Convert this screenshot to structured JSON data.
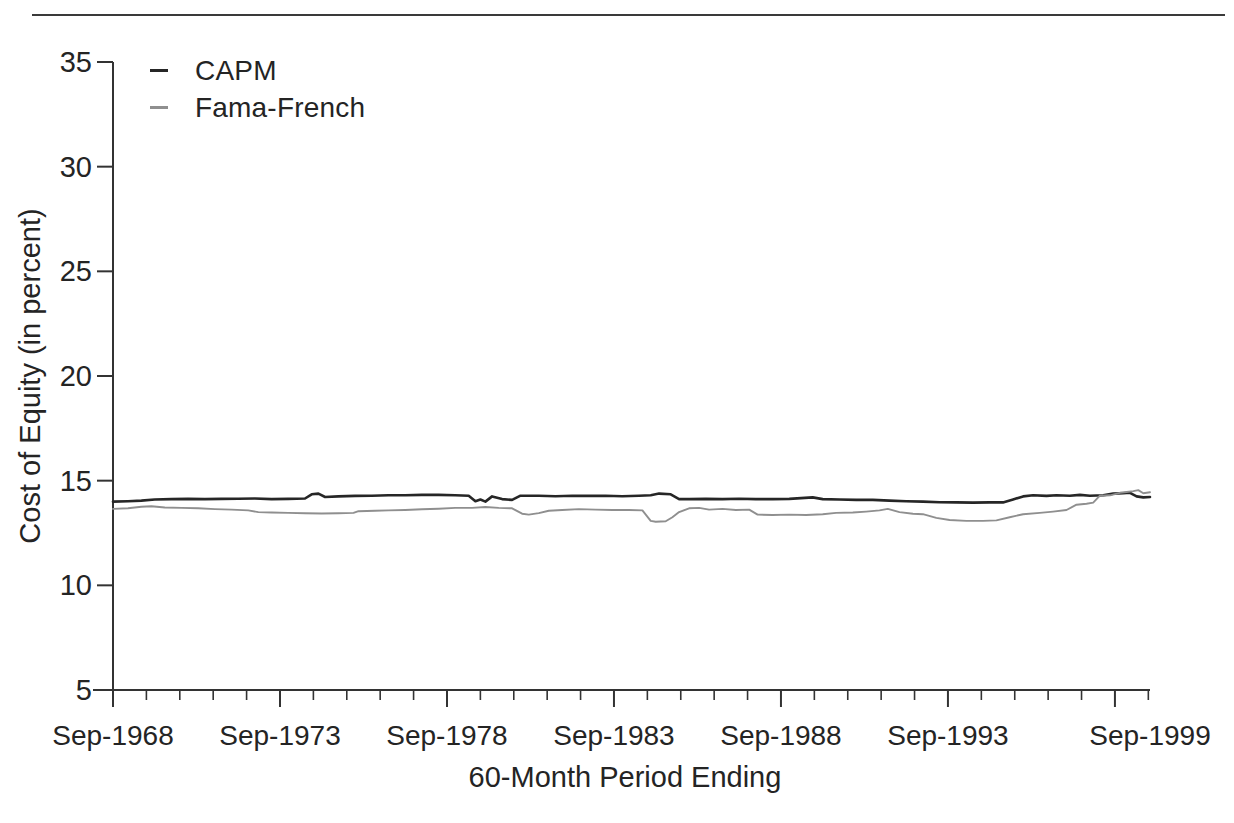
{
  "legend": {
    "items": [
      {
        "label": "CAPM",
        "color": "#262626"
      },
      {
        "label": "Fama-French",
        "color": "#8f8f8f"
      }
    ]
  },
  "chart_data": {
    "type": "line",
    "title": "",
    "xlabel": "60-Month Period Ending",
    "ylabel": "Cost of Equity (in percent)",
    "ylim": [
      5,
      35
    ],
    "y_ticks": [
      5,
      10,
      15,
      20,
      25,
      30,
      35
    ],
    "x_range_years": [
      1968.75,
      1999.8
    ],
    "x_major_tick_years": [
      1968.75,
      1973.75,
      1978.75,
      1983.75,
      1988.75,
      1993.75,
      1998.75
    ],
    "x_minor_tick_step_years": 1,
    "x_tick_labels": [
      "Sep-1968",
      "Sep-1973",
      "Sep-1978",
      "Sep-1983",
      "Sep-1988",
      "Sep-1993",
      "Sep-1999"
    ],
    "grid": false,
    "legend_position": "inside-top-left",
    "series": [
      {
        "name": "CAPM",
        "color": "#262626",
        "width": 2.6,
        "points": [
          [
            1968.75,
            14.0
          ],
          [
            1969.2,
            14.02
          ],
          [
            1969.6,
            14.05
          ],
          [
            1970.0,
            14.1
          ],
          [
            1970.5,
            14.12
          ],
          [
            1971.0,
            14.13
          ],
          [
            1971.5,
            14.12
          ],
          [
            1972.0,
            14.13
          ],
          [
            1972.5,
            14.14
          ],
          [
            1973.0,
            14.15
          ],
          [
            1973.5,
            14.12
          ],
          [
            1974.0,
            14.13
          ],
          [
            1974.5,
            14.15
          ],
          [
            1974.7,
            14.35
          ],
          [
            1974.9,
            14.38
          ],
          [
            1975.1,
            14.22
          ],
          [
            1975.5,
            14.25
          ],
          [
            1976.0,
            14.27
          ],
          [
            1976.5,
            14.28
          ],
          [
            1977.0,
            14.3
          ],
          [
            1977.5,
            14.3
          ],
          [
            1978.0,
            14.32
          ],
          [
            1978.5,
            14.32
          ],
          [
            1979.0,
            14.3
          ],
          [
            1979.4,
            14.28
          ],
          [
            1979.6,
            14.02
          ],
          [
            1979.75,
            14.1
          ],
          [
            1979.9,
            14.0
          ],
          [
            1980.1,
            14.25
          ],
          [
            1980.4,
            14.12
          ],
          [
            1980.7,
            14.08
          ],
          [
            1980.95,
            14.28
          ],
          [
            1981.5,
            14.28
          ],
          [
            1982.0,
            14.26
          ],
          [
            1982.5,
            14.28
          ],
          [
            1983.0,
            14.27
          ],
          [
            1983.5,
            14.28
          ],
          [
            1984.0,
            14.26
          ],
          [
            1984.5,
            14.28
          ],
          [
            1984.85,
            14.3
          ],
          [
            1985.1,
            14.38
          ],
          [
            1985.45,
            14.35
          ],
          [
            1985.7,
            14.12
          ],
          [
            1986.0,
            14.12
          ],
          [
            1986.5,
            14.13
          ],
          [
            1987.0,
            14.12
          ],
          [
            1987.5,
            14.14
          ],
          [
            1988.0,
            14.12
          ],
          [
            1988.5,
            14.12
          ],
          [
            1989.0,
            14.13
          ],
          [
            1989.7,
            14.2
          ],
          [
            1990.0,
            14.12
          ],
          [
            1990.5,
            14.1
          ],
          [
            1991.0,
            14.08
          ],
          [
            1991.5,
            14.08
          ],
          [
            1992.0,
            14.05
          ],
          [
            1992.5,
            14.02
          ],
          [
            1993.0,
            14.0
          ],
          [
            1993.5,
            13.97
          ],
          [
            1994.0,
            13.96
          ],
          [
            1994.5,
            13.95
          ],
          [
            1995.0,
            13.96
          ],
          [
            1995.4,
            13.96
          ],
          [
            1995.7,
            14.1
          ],
          [
            1996.0,
            14.25
          ],
          [
            1996.3,
            14.3
          ],
          [
            1996.7,
            14.27
          ],
          [
            1997.0,
            14.3
          ],
          [
            1997.4,
            14.28
          ],
          [
            1997.7,
            14.32
          ],
          [
            1998.0,
            14.28
          ],
          [
            1998.4,
            14.3
          ],
          [
            1998.7,
            14.38
          ],
          [
            1999.0,
            14.4
          ],
          [
            1999.2,
            14.42
          ],
          [
            1999.4,
            14.25
          ],
          [
            1999.6,
            14.2
          ],
          [
            1999.8,
            14.22
          ]
        ]
      },
      {
        "name": "Fama-French",
        "color": "#8f8f8f",
        "width": 1.9,
        "points": [
          [
            1968.75,
            13.65
          ],
          [
            1969.2,
            13.68
          ],
          [
            1969.6,
            13.75
          ],
          [
            1969.9,
            13.78
          ],
          [
            1970.3,
            13.72
          ],
          [
            1970.8,
            13.7
          ],
          [
            1971.3,
            13.68
          ],
          [
            1971.8,
            13.64
          ],
          [
            1972.3,
            13.62
          ],
          [
            1972.8,
            13.58
          ],
          [
            1973.1,
            13.5
          ],
          [
            1973.5,
            13.48
          ],
          [
            1974.0,
            13.46
          ],
          [
            1974.5,
            13.44
          ],
          [
            1975.0,
            13.43
          ],
          [
            1975.5,
            13.44
          ],
          [
            1975.95,
            13.46
          ],
          [
            1976.1,
            13.54
          ],
          [
            1976.6,
            13.56
          ],
          [
            1977.0,
            13.58
          ],
          [
            1977.5,
            13.6
          ],
          [
            1978.0,
            13.63
          ],
          [
            1978.5,
            13.66
          ],
          [
            1979.0,
            13.7
          ],
          [
            1979.5,
            13.7
          ],
          [
            1979.9,
            13.74
          ],
          [
            1980.3,
            13.7
          ],
          [
            1980.7,
            13.68
          ],
          [
            1981.0,
            13.42
          ],
          [
            1981.2,
            13.38
          ],
          [
            1981.5,
            13.45
          ],
          [
            1981.8,
            13.56
          ],
          [
            1982.2,
            13.6
          ],
          [
            1982.7,
            13.64
          ],
          [
            1983.2,
            13.62
          ],
          [
            1983.7,
            13.6
          ],
          [
            1984.2,
            13.6
          ],
          [
            1984.6,
            13.58
          ],
          [
            1984.85,
            13.08
          ],
          [
            1985.0,
            13.04
          ],
          [
            1985.3,
            13.06
          ],
          [
            1985.5,
            13.25
          ],
          [
            1985.7,
            13.5
          ],
          [
            1986.0,
            13.68
          ],
          [
            1986.3,
            13.7
          ],
          [
            1986.6,
            13.62
          ],
          [
            1987.0,
            13.65
          ],
          [
            1987.4,
            13.6
          ],
          [
            1987.8,
            13.62
          ],
          [
            1988.05,
            13.38
          ],
          [
            1988.5,
            13.36
          ],
          [
            1989.0,
            13.38
          ],
          [
            1989.5,
            13.36
          ],
          [
            1990.0,
            13.4
          ],
          [
            1990.4,
            13.46
          ],
          [
            1990.9,
            13.48
          ],
          [
            1991.3,
            13.52
          ],
          [
            1991.7,
            13.58
          ],
          [
            1991.95,
            13.65
          ],
          [
            1992.3,
            13.5
          ],
          [
            1992.7,
            13.42
          ],
          [
            1993.0,
            13.4
          ],
          [
            1993.4,
            13.22
          ],
          [
            1993.8,
            13.12
          ],
          [
            1994.3,
            13.08
          ],
          [
            1994.8,
            13.08
          ],
          [
            1995.2,
            13.1
          ],
          [
            1995.6,
            13.25
          ],
          [
            1996.0,
            13.4
          ],
          [
            1996.5,
            13.46
          ],
          [
            1996.9,
            13.52
          ],
          [
            1997.3,
            13.6
          ],
          [
            1997.6,
            13.85
          ],
          [
            1997.9,
            13.9
          ],
          [
            1998.1,
            13.95
          ],
          [
            1998.3,
            14.28
          ],
          [
            1998.6,
            14.3
          ],
          [
            1998.9,
            14.42
          ],
          [
            1999.1,
            14.46
          ],
          [
            1999.3,
            14.5
          ],
          [
            1999.45,
            14.55
          ],
          [
            1999.6,
            14.4
          ],
          [
            1999.8,
            14.45
          ]
        ]
      }
    ]
  }
}
